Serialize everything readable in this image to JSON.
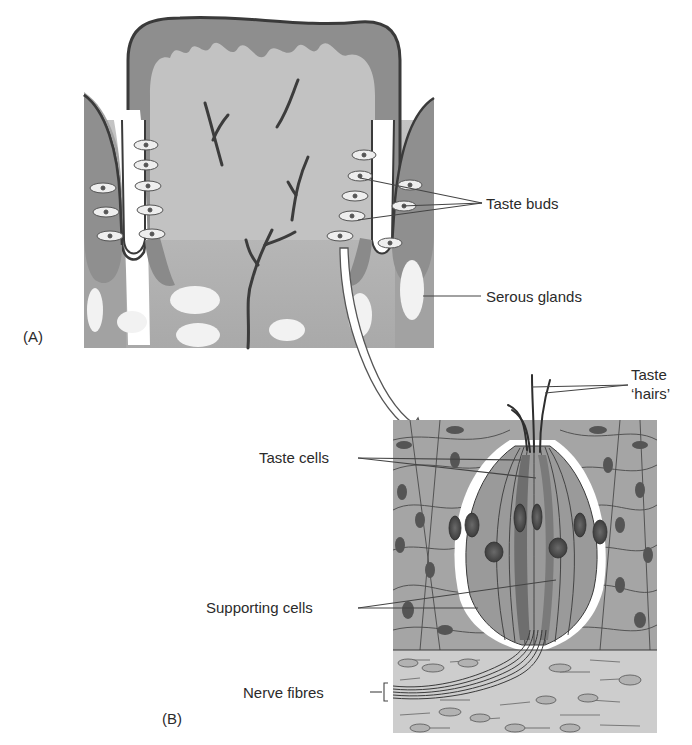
{
  "figure": {
    "panel_a": {
      "label": "(A)",
      "annotations": {
        "taste_buds": "Taste buds",
        "serous_glands": "Serous glands"
      }
    },
    "panel_b": {
      "label": "(B)",
      "annotations": {
        "taste_hairs_line1": "Taste",
        "taste_hairs_line2": "‘hairs’",
        "taste_cells": "Taste cells",
        "supporting_cells": "Supporting cells",
        "nerve_fibres": "Nerve fibres"
      }
    },
    "colors": {
      "background": "#ffffff",
      "tissue_light": "#b8b8b8",
      "tissue_mid": "#9a9a9a",
      "tissue_dark": "#7a7a7a",
      "outline": "#3a3a3a",
      "nerve": "#3c3c3c",
      "gland": "#f2f2f2",
      "connective": "#cfcfcf"
    }
  }
}
